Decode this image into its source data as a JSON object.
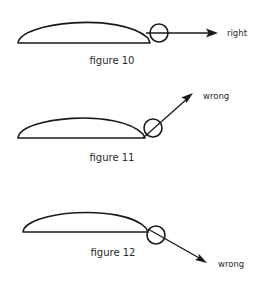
{
  "figures": [
    {
      "id": "figure-10",
      "caption": "figure 10",
      "direction_label": "right",
      "verdict": "right",
      "arrow_direction": "horizontal"
    },
    {
      "id": "figure-11",
      "caption": "figure 11",
      "direction_label": "wrong",
      "verdict": "wrong",
      "arrow_direction": "up-right"
    },
    {
      "id": "figure-12",
      "caption": "figure 12",
      "direction_label": "wrong",
      "verdict": "wrong",
      "arrow_direction": "down-right"
    }
  ],
  "colors": {
    "stroke": "#1a1a1a",
    "text": "#2a2a2a",
    "background": "#ffffff"
  }
}
